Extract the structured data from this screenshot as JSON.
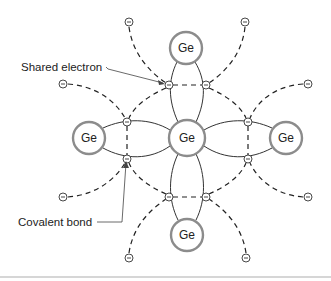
{
  "diagram": {
    "atoms": [
      {
        "id": "center",
        "label": "Ge",
        "x": 187,
        "y": 138
      },
      {
        "id": "top",
        "label": "Ge",
        "x": 186,
        "y": 48
      },
      {
        "id": "bottom",
        "label": "Ge",
        "x": 187,
        "y": 235
      },
      {
        "id": "left",
        "label": "Ge",
        "x": 89,
        "y": 138
      },
      {
        "id": "right",
        "label": "Ge",
        "x": 286,
        "y": 138
      }
    ],
    "shared_electrons": [
      {
        "x": 169,
        "y": 85
      },
      {
        "x": 206,
        "y": 85
      },
      {
        "x": 127,
        "y": 122
      },
      {
        "x": 127,
        "y": 159
      },
      {
        "x": 248,
        "y": 122
      },
      {
        "x": 248,
        "y": 159
      },
      {
        "x": 169,
        "y": 197
      },
      {
        "x": 206,
        "y": 197
      }
    ],
    "free_electrons": [
      {
        "x": 129,
        "y": 22
      },
      {
        "x": 245,
        "y": 22
      },
      {
        "x": 63,
        "y": 84
      },
      {
        "x": 308,
        "y": 84
      },
      {
        "x": 63,
        "y": 197
      },
      {
        "x": 308,
        "y": 197
      },
      {
        "x": 129,
        "y": 258
      },
      {
        "x": 246,
        "y": 258
      }
    ],
    "labels": {
      "shared_electron": "Shared electron",
      "covalent_bond": "Covalent bond"
    },
    "electron_symbol": "−"
  }
}
